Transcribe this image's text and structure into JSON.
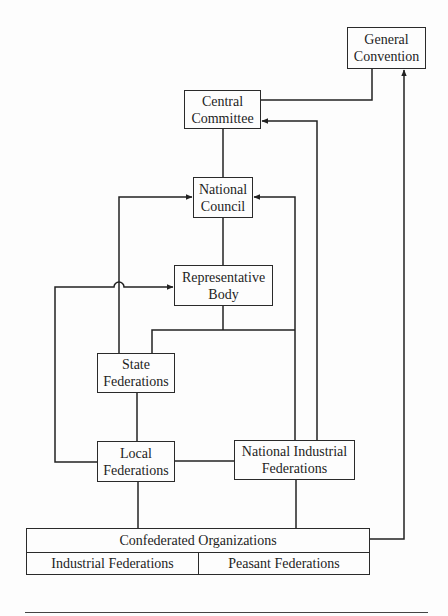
{
  "diagram": {
    "type": "organizational-flowchart",
    "nodes": {
      "general_convention": {
        "line1": "General",
        "line2": "Convention"
      },
      "central_committee": {
        "line1": "Central",
        "line2": "Committee"
      },
      "national_council": {
        "line1": "National",
        "line2": "Council"
      },
      "representative_body": {
        "line1": "Representative",
        "line2": "Body"
      },
      "state_federations": {
        "line1": "State",
        "line2": "Federations"
      },
      "local_federations": {
        "line1": "Local",
        "line2": "Federations"
      },
      "national_industrial_federations": {
        "line1": "National Industrial",
        "line2": "Federations"
      },
      "confederated_organizations": {
        "title": "Confederated Organizations",
        "left": "Industrial Federations",
        "right": "Peasant Federations"
      }
    },
    "edges": [
      {
        "from": "Central Committee",
        "to": "General Convention",
        "arrow": false
      },
      {
        "from": "Confederated Organizations",
        "to": "General Convention",
        "arrow": true
      },
      {
        "from": "Central Committee",
        "to": "National Council",
        "arrow": false
      },
      {
        "from": "National Industrial Federations",
        "to": "Central Committee",
        "arrow": true
      },
      {
        "from": "State Federations",
        "to": "National Council",
        "arrow": true
      },
      {
        "from": "National Industrial Federations",
        "to": "National Council",
        "arrow": true
      },
      {
        "from": "National Council",
        "to": "Representative Body",
        "arrow": false
      },
      {
        "from": "Local Federations",
        "to": "Representative Body",
        "arrow": true
      },
      {
        "from": "Representative Body",
        "to": "State Federations",
        "arrow": false
      },
      {
        "from": "State Federations",
        "to": "Local Federations",
        "arrow": false
      },
      {
        "from": "Local Federations",
        "to": "National Industrial Federations",
        "arrow": false
      },
      {
        "from": "Local Federations",
        "to": "Confederated Organizations",
        "arrow": false
      },
      {
        "from": "National Industrial Federations",
        "to": "Confederated Organizations",
        "arrow": false
      }
    ]
  }
}
